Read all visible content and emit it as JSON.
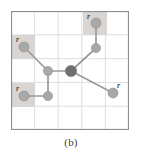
{
  "figure": {
    "caption": "(b)",
    "frame": {
      "border_color": "#8d8d8d",
      "background_color": "#ffffff",
      "grid_color": "#d6d6d6",
      "grid_rows": 5,
      "grid_cols": 5
    },
    "style": {
      "node_color": "#a8a8a8",
      "node_stroke_color": "#8f8f8f",
      "root_node_color": "#6f6f6f",
      "edge_color": "#9a9a9a",
      "shaded_cell_color": "#d8d5d2",
      "label_color": "#4a4a4a"
    },
    "nodes": [
      {
        "id": "n-top-r",
        "label": "r",
        "cx": 85,
        "cy": 12,
        "radius": 5.0,
        "kind": "leaf"
      },
      {
        "id": "n-top-mid",
        "label": "",
        "cx": 85,
        "cy": 37,
        "radius": 4.6,
        "kind": "internal"
      },
      {
        "id": "n-left-r",
        "label": "r",
        "cx": 13,
        "cy": 36,
        "radius": 5.0,
        "kind": "leaf"
      },
      {
        "id": "n-left-mid",
        "label": "",
        "cx": 37,
        "cy": 60,
        "radius": 4.6,
        "kind": "internal"
      },
      {
        "id": "n-center",
        "label": "",
        "cx": 60,
        "cy": 60,
        "radius": 5.6,
        "kind": "root"
      },
      {
        "id": "n-bottom-r",
        "label": "r",
        "cx": 13,
        "cy": 85,
        "radius": 5.0,
        "kind": "leaf"
      },
      {
        "id": "n-bottom-mid",
        "label": "",
        "cx": 37,
        "cy": 85,
        "radius": 4.6,
        "kind": "internal"
      },
      {
        "id": "n-right-r",
        "label": "r",
        "cx": 102,
        "cy": 82,
        "radius": 5.0,
        "kind": "leaf"
      }
    ],
    "edges": [
      {
        "id": "e-top",
        "from": "n-top-r",
        "to": "n-top-mid"
      },
      {
        "id": "e-top-ctr",
        "from": "n-top-mid",
        "to": "n-center"
      },
      {
        "id": "e-left",
        "from": "n-left-r",
        "to": "n-left-mid"
      },
      {
        "id": "e-left-ctr",
        "from": "n-left-mid",
        "to": "n-center"
      },
      {
        "id": "e-vert",
        "from": "n-left-mid",
        "to": "n-bottom-mid"
      },
      {
        "id": "e-bottom",
        "from": "n-bottom-r",
        "to": "n-bottom-mid"
      },
      {
        "id": "e-right",
        "from": "n-center",
        "to": "n-right-r"
      }
    ],
    "shaded_cells": [
      {
        "id": "cell-top-right",
        "x": 72,
        "y": 0,
        "width": 24,
        "height": 24
      },
      {
        "id": "cell-left-upper",
        "x": 0,
        "y": 24,
        "width": 24,
        "height": 24
      },
      {
        "id": "cell-left-lower",
        "x": 0,
        "y": 72,
        "width": 24,
        "height": 24
      }
    ],
    "labels": [
      {
        "id": "label-r-top",
        "text": "r",
        "x": 76,
        "y": 8
      },
      {
        "id": "label-r-left",
        "text": "r",
        "x": 5,
        "y": 31
      },
      {
        "id": "label-r-bottom",
        "text": "r",
        "x": 5,
        "y": 80
      },
      {
        "id": "label-r-right",
        "text": "r",
        "x": 106,
        "y": 77
      }
    ]
  }
}
